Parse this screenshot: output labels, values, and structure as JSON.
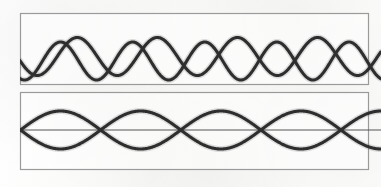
{
  "figure": {
    "name": "wave-interference-beats-figure",
    "background_color": "#fbfbfa",
    "width": 381,
    "height": 187
  },
  "style": {
    "ink_color": "#2e2e2e",
    "ink_halo_color": "#6f6f6f",
    "frame_color": "#9a9a9a",
    "axis_color": "#545454",
    "panel_fill": "#ffffff",
    "wave_stroke_width": 3.1,
    "halo_stroke_width": 6.0,
    "frame_stroke_width": 1.2,
    "axis_stroke_width": 1.0
  },
  "panels": [
    {
      "id": "top-panel",
      "name": "component-waves-panel",
      "frame": {
        "x": 20.5,
        "y": 13.5,
        "width": 348,
        "height": 71
      },
      "has_axis_line": false,
      "clip_right": true,
      "description": "Two superimposed sinusoids of nearly equal frequency drifting in and out of phase",
      "center_y": 58,
      "waves": [
        {
          "id": "wave-a",
          "name": "component-wave-a",
          "cycles": 4.5,
          "amplitude": 19,
          "phase_deg": 195,
          "vertical_offset": -1.5,
          "x_start": 20,
          "x_end": 381
        },
        {
          "id": "wave-b",
          "name": "component-wave-b",
          "cycles": 5.0,
          "amplitude": 19,
          "phase_deg": 250,
          "vertical_offset": 3.0,
          "x_start": 20,
          "x_end": 381
        }
      ]
    },
    {
      "id": "bottom-panel",
      "name": "beat-pattern-panel",
      "frame": {
        "x": 20.5,
        "y": 92.5,
        "width": 348,
        "height": 77
      },
      "has_axis_line": true,
      "clip_right": true,
      "description": "Resultant beat waveform: fast carrier inside a slowly varying envelope, producing nodes where the components cancel",
      "center_y": 130,
      "axis": {
        "id": "beat-axis",
        "name": "beat-axis-line",
        "y": 130,
        "x_start": 21,
        "x_end": 381
      },
      "envelope": {
        "id": "beat-envelope",
        "name": "beat-envelope",
        "beats": 4.5,
        "amplitude": 19,
        "phase_deg": 0,
        "node_count": 5
      },
      "carrier": {
        "id": "beat-carrier",
        "name": "beat-carrier-wave",
        "cycles": 4.5,
        "phase_deg": 0
      },
      "waves": [
        {
          "id": "envelope-upper",
          "name": "beat-envelope-upper-lobe",
          "sign": 1,
          "x_start": 20,
          "x_end": 381
        },
        {
          "id": "envelope-lower",
          "name": "beat-envelope-lower-lobe",
          "sign": -1,
          "x_start": 20,
          "x_end": 381
        }
      ]
    }
  ],
  "chart_data": {
    "type": "line",
    "title": "",
    "xlabel": "",
    "ylabel": "",
    "grid": false,
    "legend": null,
    "panel_count": 2,
    "panels": [
      {
        "panel": "top",
        "description": "Two component sine waves of slightly different frequency superimposed",
        "xlim": [
          0,
          1
        ],
        "ylim": [
          -1,
          1
        ],
        "series": [
          {
            "name": "component-wave-a",
            "cycles": 4.5,
            "amplitude": 1.0,
            "phase_deg": 195
          },
          {
            "name": "component-wave-b",
            "cycles": 5.0,
            "amplitude": 1.0,
            "phase_deg": 250
          }
        ]
      },
      {
        "panel": "bottom",
        "description": "Resultant beat pattern with envelope lobes and nodes",
        "xlim": [
          0,
          1
        ],
        "ylim": [
          -1,
          1
        ],
        "node_positions": [
          0.0,
          0.222,
          0.444,
          0.667,
          0.889
        ],
        "antinode_positions": [
          0.111,
          0.333,
          0.556,
          0.778,
          1.0
        ],
        "series": [
          {
            "name": "beat-envelope-upper-lobe",
            "beats": 4.5,
            "amplitude": 1.0
          },
          {
            "name": "beat-envelope-lower-lobe",
            "beats": 4.5,
            "amplitude": -1.0
          },
          {
            "name": "beat-axis-line",
            "value": 0
          }
        ]
      }
    ]
  }
}
